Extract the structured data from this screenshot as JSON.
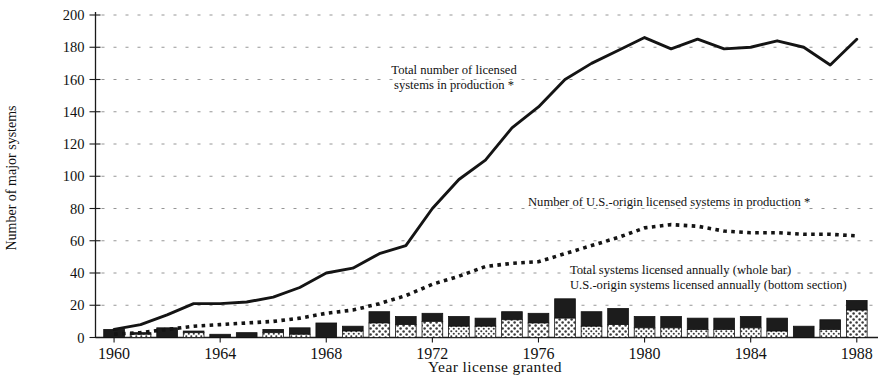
{
  "chart_data": {
    "type": "bar",
    "title": "",
    "xlabel": "Year license granted",
    "ylabel": "Number of major systems",
    "xlim": [
      1959.3,
      1988.8
    ],
    "ylim": [
      0,
      200
    ],
    "ytick_step": 20,
    "grid": true,
    "legend_position": "inline-annotations",
    "yticks": [
      0,
      20,
      40,
      60,
      80,
      100,
      120,
      140,
      160,
      180,
      200
    ],
    "ytick_labels": [
      "0",
      "20",
      "40",
      "60",
      "80",
      "100",
      "120",
      "140",
      "160",
      "180",
      "200"
    ],
    "xticks": [
      1960,
      1964,
      1968,
      1972,
      1976,
      1980,
      1984,
      1988
    ],
    "xtick_labels": [
      "1960",
      "1964",
      "1968",
      "1972",
      "1976",
      "1980",
      "1984",
      "1988"
    ],
    "categories": [
      1960,
      1961,
      1962,
      1963,
      1964,
      1965,
      1966,
      1967,
      1968,
      1969,
      1970,
      1971,
      1972,
      1973,
      1974,
      1975,
      1976,
      1977,
      1978,
      1979,
      1980,
      1981,
      1982,
      1983,
      1984,
      1985,
      1986,
      1987,
      1988
    ],
    "series": [
      {
        "name": "Total systems licensed annually (whole bar)",
        "type": "bar",
        "stack": "annual",
        "style": "dark-top-section",
        "values": [
          5,
          3,
          6,
          4,
          2,
          3,
          5,
          6,
          9,
          7,
          16,
          13,
          15,
          13,
          12,
          16,
          15,
          24,
          16,
          18,
          13,
          13,
          12,
          12,
          13,
          12,
          7,
          11,
          23
        ]
      },
      {
        "name": "U.S.-origin systems licensed annually (bottom section)",
        "type": "bar",
        "stack": "annual",
        "style": "stippled-bottom-section",
        "values": [
          0,
          2,
          0,
          3,
          0,
          0,
          3,
          2,
          0,
          4,
          9,
          8,
          10,
          7,
          7,
          11,
          9,
          12,
          7,
          8,
          6,
          6,
          5,
          5,
          6,
          4,
          0,
          5,
          17
        ]
      },
      {
        "name": "Total number of licensed systems in production *",
        "type": "line",
        "style": "solid",
        "values": [
          5,
          8,
          14,
          21,
          21,
          22,
          25,
          31,
          40,
          43,
          52,
          57,
          80,
          98,
          110,
          130,
          143,
          160,
          170,
          178,
          186,
          179,
          185,
          179,
          180,
          184,
          180,
          169,
          185
        ]
      },
      {
        "name": "Number of U.S.-origin licensed systems in production *",
        "type": "line",
        "style": "dotted",
        "values": [
          2,
          3,
          5,
          7,
          8,
          9,
          10,
          12,
          15,
          17,
          21,
          26,
          33,
          38,
          44,
          46,
          47,
          52,
          57,
          62,
          68,
          70,
          69,
          66,
          65,
          65,
          64,
          64,
          63
        ]
      }
    ],
    "annotations": [
      {
        "id": "total-line-label",
        "lines": [
          "Total number of licensed",
          "systems in production *"
        ],
        "x": 454,
        "y": 74,
        "align": "middle"
      },
      {
        "id": "us-line-label",
        "lines": [
          "Number of U.S.-origin licensed systems in production *"
        ],
        "x": 528,
        "y": 206,
        "align": "start"
      },
      {
        "id": "bar-legend-label",
        "lines": [
          "Total systems licensed annually (whole bar)",
          "U.S.-origin systems licensed annually (bottom section)"
        ],
        "x": 570,
        "y": 274,
        "align": "start"
      }
    ],
    "colors": {
      "bar_top": "#1c1c1c",
      "bar_bottom_fill": "#d8d8d8",
      "line": "#141414",
      "grid": "#8a8a8a",
      "axis": "#1a1a1a",
      "background": "#ffffff"
    }
  }
}
